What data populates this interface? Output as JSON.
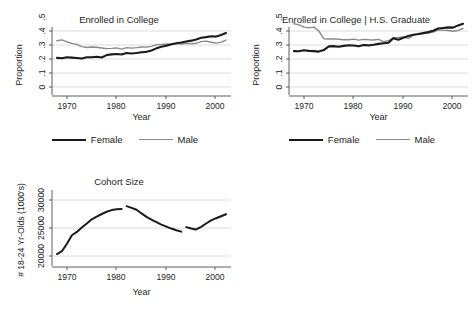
{
  "figure": {
    "background": "#ffffff",
    "female_color": "#1a1a1a",
    "male_color": "#8a8a8a",
    "grid_color": "#d9d9d9",
    "axis_color": "#4d4d4d"
  },
  "legend": {
    "female_label": "Female",
    "male_label": "Male"
  },
  "chart_data": [
    {
      "type": "line",
      "title": "Enrolled in College",
      "xlabel": "Year",
      "ylabel": "Proportion",
      "xlim": [
        1967,
        2003
      ],
      "ylim": [
        0,
        0.5
      ],
      "xticks": [
        1970,
        1980,
        1990,
        2000
      ],
      "xticklabels": [
        "1970",
        "1980",
        "1990",
        "2000"
      ],
      "yticks": [
        0,
        0.1,
        0.2,
        0.3,
        0.4,
        0.5
      ],
      "yticklabels": [
        "0",
        ".1",
        ".2",
        ".3",
        ".4",
        ".5"
      ],
      "grid": "horizontal",
      "legend_position": "below",
      "x": [
        1968,
        1969,
        1970,
        1971,
        1972,
        1973,
        1974,
        1975,
        1976,
        1977,
        1978,
        1979,
        1980,
        1981,
        1982,
        1983,
        1984,
        1985,
        1986,
        1987,
        1988,
        1989,
        1990,
        1991,
        1992,
        1993,
        1994,
        1995,
        1996,
        1997,
        1998,
        1999,
        2000,
        2001,
        2002
      ],
      "series": [
        {
          "name": "Female",
          "values": [
            0.208,
            0.205,
            0.212,
            0.21,
            0.207,
            0.203,
            0.213,
            0.212,
            0.216,
            0.211,
            0.228,
            0.233,
            0.236,
            0.232,
            0.243,
            0.239,
            0.243,
            0.248,
            0.251,
            0.261,
            0.276,
            0.287,
            0.295,
            0.305,
            0.313,
            0.318,
            0.325,
            0.331,
            0.34,
            0.352,
            0.356,
            0.362,
            0.36,
            0.372,
            0.385
          ]
        },
        {
          "name": "Male",
          "values": [
            0.33,
            0.337,
            0.323,
            0.312,
            0.304,
            0.288,
            0.282,
            0.286,
            0.284,
            0.279,
            0.274,
            0.276,
            0.279,
            0.271,
            0.281,
            0.278,
            0.281,
            0.286,
            0.285,
            0.29,
            0.303,
            0.304,
            0.307,
            0.304,
            0.312,
            0.307,
            0.312,
            0.308,
            0.312,
            0.324,
            0.328,
            0.32,
            0.313,
            0.321,
            0.335
          ]
        }
      ]
    },
    {
      "type": "line",
      "title": "Enrolled in College | H.S. Graduate",
      "xlabel": "Year",
      "ylabel": "Proportion",
      "xlim": [
        1967,
        2003
      ],
      "ylim": [
        0,
        0.5
      ],
      "xticks": [
        1970,
        1980,
        1990,
        2000
      ],
      "xticklabels": [
        "1970",
        "1980",
        "1990",
        "2000"
      ],
      "yticks": [
        0,
        0.1,
        0.2,
        0.3,
        0.4,
        0.5
      ],
      "yticklabels": [
        "0",
        ".1",
        ".2",
        ".3",
        ".4",
        ".5"
      ],
      "grid": "horizontal",
      "legend_position": "below",
      "x": [
        1968,
        1969,
        1970,
        1971,
        1972,
        1973,
        1974,
        1975,
        1976,
        1977,
        1978,
        1979,
        1980,
        1981,
        1982,
        1983,
        1984,
        1985,
        1986,
        1987,
        1988,
        1989,
        1990,
        1991,
        1992,
        1993,
        1994,
        1995,
        1996,
        1997,
        1998,
        1999,
        2000,
        2001,
        2002
      ],
      "series": [
        {
          "name": "Female",
          "values": [
            0.256,
            0.255,
            0.262,
            0.258,
            0.256,
            0.253,
            0.264,
            0.29,
            0.292,
            0.288,
            0.294,
            0.298,
            0.296,
            0.291,
            0.3,
            0.297,
            0.302,
            0.308,
            0.312,
            0.316,
            0.348,
            0.338,
            0.352,
            0.364,
            0.373,
            0.378,
            0.385,
            0.392,
            0.402,
            0.418,
            0.422,
            0.426,
            0.424,
            0.44,
            0.452
          ]
        },
        {
          "name": "Male",
          "values": [
            0.452,
            0.444,
            0.428,
            0.422,
            0.428,
            0.4,
            0.345,
            0.343,
            0.344,
            0.341,
            0.337,
            0.338,
            0.342,
            0.335,
            0.34,
            0.337,
            0.336,
            0.34,
            0.324,
            0.33,
            0.352,
            0.354,
            0.358,
            0.346,
            0.37,
            0.378,
            0.382,
            0.386,
            0.392,
            0.408,
            0.406,
            0.404,
            0.398,
            0.404,
            0.418
          ]
        }
      ]
    },
    {
      "type": "line",
      "title": "Cohort Size",
      "xlabel": "Year",
      "ylabel": "# 18-24 Yr-Olds (1000's)",
      "xlim": [
        1967,
        2003
      ],
      "ylim": [
        19000,
        31000
      ],
      "xticks": [
        1970,
        1980,
        1990,
        2000
      ],
      "xticklabels": [
        "1970",
        "1980",
        "1990",
        "2000"
      ],
      "yticks": [
        20000,
        25000,
        30000
      ],
      "yticklabels": [
        "20000",
        "25000",
        "30000"
      ],
      "grid": "horizontal",
      "legend_position": "none",
      "segments": [
        {
          "x": [
            1968,
            1969,
            1970,
            1971,
            1972,
            1973,
            1974,
            1975,
            1976,
            1977,
            1978,
            1979,
            1980,
            1981
          ],
          "values": [
            20350,
            20850,
            22200,
            23700,
            24300,
            25100,
            25800,
            26550,
            27050,
            27500,
            27900,
            28200,
            28350,
            28380
          ]
        },
        {
          "x": [
            1982,
            1983,
            1984,
            1985,
            1986,
            1987,
            1988,
            1989,
            1990,
            1991,
            1992,
            1993
          ],
          "values": [
            28900,
            28600,
            28250,
            27600,
            27000,
            26500,
            26050,
            25600,
            25250,
            24900,
            24600,
            24350
          ]
        },
        {
          "x": [
            1994,
            1995,
            1996,
            1997,
            1998,
            1999,
            2000,
            2001,
            2002
          ],
          "values": [
            25150,
            24900,
            24750,
            25200,
            25800,
            26350,
            26750,
            27100,
            27450
          ]
        }
      ],
      "series": [
        {
          "name": "Cohort Size",
          "values": []
        }
      ]
    }
  ]
}
